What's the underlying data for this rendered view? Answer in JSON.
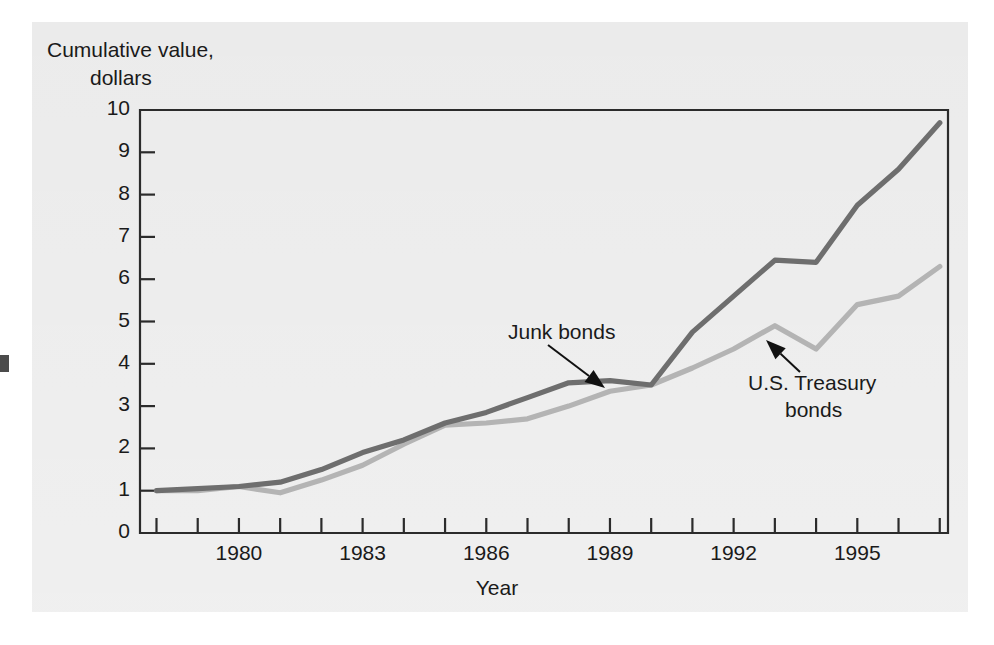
{
  "figure": {
    "background_color": "#e9e9e9",
    "page_color": "#ffffff",
    "plot_frame_color": "#2b2b2b"
  },
  "axis": {
    "y_title_line1": "Cumulative value,",
    "y_title_line2": "dollars",
    "x_title": "Year",
    "y_ticks": [
      "10",
      "9",
      "8",
      "7",
      "6",
      "5",
      "4",
      "3",
      "2",
      "1",
      "0"
    ],
    "x_ticks": [
      "1980",
      "1983",
      "1986",
      "1989",
      "1992",
      "1995"
    ]
  },
  "annotations": {
    "junk": "Junk bonds",
    "treasury_line1": "U.S. Treasury",
    "treasury_line2": "bonds"
  },
  "chart_data": {
    "type": "line",
    "title": "",
    "subtitle": "",
    "xlabel": "Year",
    "ylabel": "Cumulative value, dollars",
    "xlim": [
      1977.6,
      1997.2
    ],
    "ylim": [
      0,
      10
    ],
    "grid": false,
    "legend_position": "inline-annotations",
    "x_tick_interval_years": 1,
    "x_labeled_ticks": [
      1980,
      1983,
      1986,
      1989,
      1992,
      1995
    ],
    "y_tick_interval": 1,
    "x": [
      1978,
      1979,
      1980,
      1981,
      1982,
      1983,
      1984,
      1985,
      1986,
      1987,
      1988,
      1989,
      1990,
      1991,
      1992,
      1993,
      1994,
      1995,
      1996,
      1997
    ],
    "series": [
      {
        "name": "Junk bonds",
        "color": "#6e6e6e",
        "values": [
          1.0,
          1.05,
          1.1,
          1.2,
          1.5,
          1.9,
          2.2,
          2.6,
          2.85,
          3.2,
          3.55,
          3.6,
          3.5,
          4.75,
          5.6,
          6.45,
          6.4,
          7.75,
          8.6,
          9.7
        ]
      },
      {
        "name": "U.S. Treasury bonds",
        "color": "#b4b4b4",
        "values": [
          1.0,
          1.0,
          1.1,
          0.95,
          1.25,
          1.6,
          2.1,
          2.55,
          2.6,
          2.7,
          3.0,
          3.35,
          3.5,
          3.9,
          4.35,
          4.9,
          4.35,
          5.4,
          5.6,
          6.3
        ]
      }
    ],
    "annotations": [
      {
        "text": "Junk bonds",
        "target_x": 1987.6,
        "target_y": 3.35,
        "label_x": 1986.2,
        "label_y": 4.6
      },
      {
        "text": "U.S. Treasury bonds",
        "target_x": 1992.2,
        "target_y": 4.45,
        "label_x": 1993.6,
        "label_y": 3.3
      }
    ]
  }
}
